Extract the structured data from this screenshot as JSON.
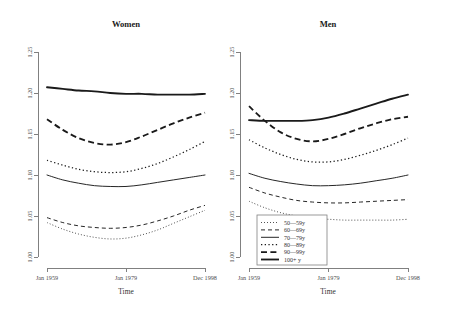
{
  "chart_data": {
    "type": "line",
    "title": "",
    "xlabel": "Time",
    "ylabel": "",
    "xticklabels": [
      "Jan 1959",
      "Jan 1979",
      "Dec 1998"
    ],
    "xtickpositions": [
      0,
      0.5,
      1
    ],
    "yticklabels": [
      "1.00",
      "1.05",
      "1.10",
      "1.15",
      "1.20",
      "1.25"
    ],
    "ylim": [
      1.0,
      1.25
    ],
    "grid": false,
    "legend_position": "bottom-left-of-right-panel",
    "legend_entries": [
      "50—59y",
      "60—69y",
      "70—79y",
      "80—89y",
      "90—99y",
      "100+ y"
    ],
    "panels": [
      {
        "title": "Women",
        "series": [
          {
            "name": "50—59y",
            "style": "fine-dotted",
            "values": [
              1.042,
              1.034,
              1.028,
              1.024,
              1.022,
              1.023,
              1.027,
              1.033,
              1.041,
              1.049,
              1.057
            ]
          },
          {
            "name": "60—69y",
            "style": "dashed",
            "values": [
              1.048,
              1.042,
              1.038,
              1.036,
              1.035,
              1.036,
              1.039,
              1.044,
              1.05,
              1.057,
              1.063
            ]
          },
          {
            "name": "70—79y",
            "style": "solid-thin",
            "values": [
              1.1,
              1.094,
              1.09,
              1.087,
              1.086,
              1.086,
              1.088,
              1.091,
              1.094,
              1.097,
              1.1
            ]
          },
          {
            "name": "80—89y",
            "style": "coarse-dotted",
            "values": [
              1.118,
              1.112,
              1.107,
              1.104,
              1.103,
              1.104,
              1.108,
              1.114,
              1.122,
              1.131,
              1.141
            ]
          },
          {
            "name": "90—99y",
            "style": "thick-dashed",
            "values": [
              1.168,
              1.155,
              1.145,
              1.139,
              1.137,
              1.14,
              1.147,
              1.155,
              1.163,
              1.17,
              1.176
            ]
          },
          {
            "name": "100+ y",
            "style": "thick-solid",
            "values": [
              1.207,
              1.205,
              1.203,
              1.202,
              1.2,
              1.199,
              1.199,
              1.198,
              1.198,
              1.198,
              1.199
            ]
          }
        ]
      },
      {
        "title": "Men",
        "series": [
          {
            "name": "50—59y",
            "style": "fine-dotted",
            "values": [
              1.068,
              1.06,
              1.054,
              1.05,
              1.047,
              1.046,
              1.045,
              1.045,
              1.045,
              1.045,
              1.046
            ]
          },
          {
            "name": "60—69y",
            "style": "dashed",
            "values": [
              1.085,
              1.078,
              1.073,
              1.069,
              1.067,
              1.066,
              1.066,
              1.067,
              1.068,
              1.069,
              1.07
            ]
          },
          {
            "name": "70—79y",
            "style": "solid-thin",
            "values": [
              1.102,
              1.096,
              1.092,
              1.089,
              1.087,
              1.087,
              1.088,
              1.09,
              1.093,
              1.096,
              1.1
            ]
          },
          {
            "name": "80—89y",
            "style": "coarse-dotted",
            "values": [
              1.143,
              1.133,
              1.125,
              1.119,
              1.116,
              1.116,
              1.119,
              1.124,
              1.13,
              1.137,
              1.145
            ]
          },
          {
            "name": "90—99y",
            "style": "thick-dashed",
            "values": [
              1.184,
              1.166,
              1.152,
              1.144,
              1.141,
              1.144,
              1.15,
              1.157,
              1.163,
              1.168,
              1.171
            ]
          },
          {
            "name": "100+ y",
            "style": "thick-solid",
            "values": [
              1.167,
              1.166,
              1.166,
              1.166,
              1.167,
              1.17,
              1.175,
              1.181,
              1.187,
              1.193,
              1.198
            ]
          }
        ]
      }
    ]
  }
}
